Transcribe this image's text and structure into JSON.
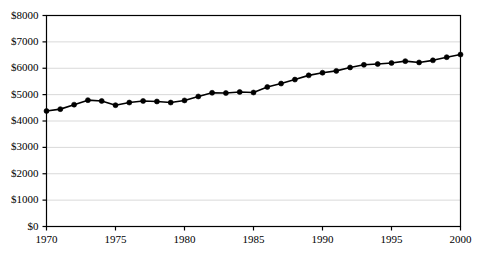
{
  "chart_data": {
    "type": "line",
    "title": "",
    "subtitle": "",
    "xlabel": "",
    "ylabel": "",
    "xlim": [
      1970,
      2000
    ],
    "ylim": [
      0,
      8000
    ],
    "grid": true,
    "legend": null,
    "marker": "filled-circle",
    "line_color": "#000000",
    "marker_color": "#000000",
    "grid_color": "#d9d9d9",
    "axis_color": "#000000",
    "background": "#ffffff",
    "x": [
      1970,
      1971,
      1972,
      1973,
      1974,
      1975,
      1976,
      1977,
      1978,
      1979,
      1980,
      1981,
      1982,
      1983,
      1984,
      1985,
      1986,
      1987,
      1988,
      1989,
      1990,
      1991,
      1992,
      1993,
      1994,
      1995,
      1996,
      1997,
      1998,
      1999,
      2000
    ],
    "values": [
      4380,
      4450,
      4620,
      4790,
      4760,
      4600,
      4700,
      4760,
      4740,
      4700,
      4780,
      4930,
      5070,
      5060,
      5100,
      5080,
      5290,
      5420,
      5570,
      5730,
      5830,
      5900,
      6030,
      6130,
      6160,
      6200,
      6270,
      6220,
      6300,
      6420,
      6520
    ],
    "y_ticks": [
      0,
      1000,
      2000,
      3000,
      4000,
      5000,
      6000,
      7000,
      8000
    ],
    "y_tick_labels": [
      "$0",
      "$1000",
      "$2000",
      "$3000",
      "$4000",
      "$5000",
      "$6000",
      "$7000",
      "$8000"
    ],
    "x_ticks": [
      1970,
      1975,
      1980,
      1985,
      1990,
      1995,
      2000
    ],
    "x_tick_labels": [
      "1970",
      "1975",
      "1980",
      "1985",
      "1990",
      "1995",
      "2000"
    ],
    "series": [
      {
        "name": "",
        "values": [
          4380,
          4450,
          4620,
          4790,
          4760,
          4600,
          4700,
          4760,
          4740,
          4700,
          4780,
          4930,
          5070,
          5060,
          5100,
          5080,
          5290,
          5420,
          5570,
          5730,
          5830,
          5900,
          6030,
          6130,
          6160,
          6200,
          6270,
          6220,
          6300,
          6420,
          6520
        ]
      }
    ]
  }
}
